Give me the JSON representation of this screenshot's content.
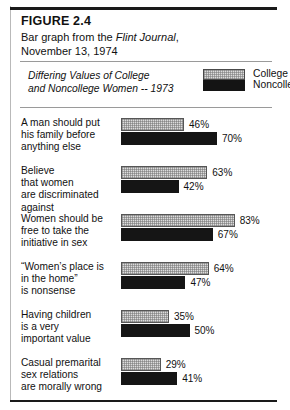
{
  "figure": {
    "number": "FIGURE 2.4",
    "caption_lead": "Bar graph from the ",
    "caption_source": "Flint Journal",
    "caption_tail": ",",
    "caption_line2": "November 13, 1974"
  },
  "chart_title_line1": "Differing Values of College",
  "chart_title_line2": "and Noncollege Women -- 1973",
  "legend": {
    "items": [
      {
        "label": "College",
        "swatch": "dotted-gray",
        "color": "#dcdcdc"
      },
      {
        "label": "Noncollege",
        "swatch": "solid-black",
        "color": "#141414"
      }
    ]
  },
  "chart_data": {
    "type": "bar",
    "title": "Differing Values of College and Noncollege Women -- 1973",
    "orientation": "horizontal",
    "xlabel": "",
    "ylabel": "",
    "xlim": [
      0,
      100
    ],
    "grid": false,
    "legend_position": "top-right",
    "value_suffix": "%",
    "categories": [
      "A man should put his family before anything else",
      "Believe that women are discriminated against",
      "Women should be free to take the initiative in sex",
      "“Women’s place is in the home” is nonsense",
      "Having children is a very important value",
      "Casual premarital sex relations are morally wrong"
    ],
    "series": [
      {
        "name": "College",
        "values": [
          46,
          63,
          83,
          64,
          35,
          29
        ]
      },
      {
        "name": "Noncollege",
        "values": [
          70,
          42,
          67,
          47,
          50,
          41
        ]
      }
    ]
  },
  "groups": [
    {
      "label_lines": [
        "A man should put",
        "his family before",
        "anything else"
      ],
      "college": {
        "value": 46,
        "text": "46%"
      },
      "noncollege": {
        "value": 70,
        "text": "70%"
      }
    },
    {
      "label_lines": [
        "Believe",
        "that women",
        "are discriminated",
        "against"
      ],
      "college": {
        "value": 63,
        "text": "63%"
      },
      "noncollege": {
        "value": 42,
        "text": "42%"
      }
    },
    {
      "label_lines": [
        "Women should be",
        "free to take the",
        "initiative in sex"
      ],
      "college": {
        "value": 83,
        "text": "83%"
      },
      "noncollege": {
        "value": 67,
        "text": "67%"
      }
    },
    {
      "label_lines": [
        "“Women’s place is",
        "in the home”",
        "is nonsense"
      ],
      "college": {
        "value": 64,
        "text": "64%"
      },
      "noncollege": {
        "value": 47,
        "text": "47%"
      }
    },
    {
      "label_lines": [
        "Having children",
        "is a very",
        "important value"
      ],
      "college": {
        "value": 35,
        "text": "35%"
      },
      "noncollege": {
        "value": 50,
        "text": "50%"
      }
    },
    {
      "label_lines": [
        "Casual premarital",
        "sex relations",
        "are morally wrong"
      ],
      "college": {
        "value": 29,
        "text": "29%"
      },
      "noncollege": {
        "value": 41,
        "text": "41%"
      }
    }
  ],
  "scale": {
    "px_per_percent": 1.37
  }
}
